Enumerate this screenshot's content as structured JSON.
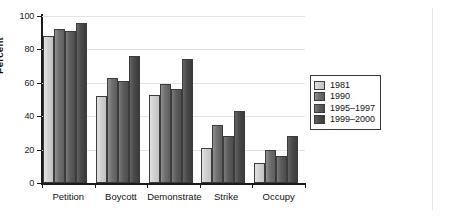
{
  "chart_data": {
    "type": "bar",
    "title": "",
    "subtitle": "",
    "xlabel": "",
    "ylabel": "Percent",
    "ylim": [
      0,
      100
    ],
    "yticks": [
      0,
      20,
      40,
      60,
      80,
      100
    ],
    "ytick_labels": [
      "0",
      "20",
      "40",
      "60",
      "80",
      "100"
    ],
    "grid": true,
    "legend_position": "right",
    "categories": [
      "Petition",
      "Boycott",
      "Demonstrate",
      "Strike",
      "Occupy"
    ],
    "series": [
      {
        "name": "1981",
        "color": "#d6d6d6",
        "values": [
          88,
          52,
          53,
          21,
          12
        ]
      },
      {
        "name": "1990",
        "color": "#6f6f6f",
        "values": [
          92,
          63,
          59,
          35,
          20
        ]
      },
      {
        "name": "1995–1997",
        "color": "#5d5d5d",
        "values": [
          91,
          61,
          56,
          28,
          16
        ]
      },
      {
        "name": "1999–2000",
        "color": "#4a4a4a",
        "values": [
          96,
          76,
          74,
          43,
          28
        ]
      }
    ]
  },
  "legend": {
    "items": [
      {
        "label": "1981"
      },
      {
        "label": "1990"
      },
      {
        "label": "1995–1997"
      },
      {
        "label": "1999–2000"
      }
    ]
  },
  "axes": {
    "y_label": "Percent",
    "y_tick_labels": [
      "100",
      "80",
      "60",
      "40",
      "20",
      "0"
    ],
    "x_tick_labels": [
      "Petition",
      "Boycott",
      "Demonstrate",
      "Strike",
      "Occupy"
    ]
  }
}
